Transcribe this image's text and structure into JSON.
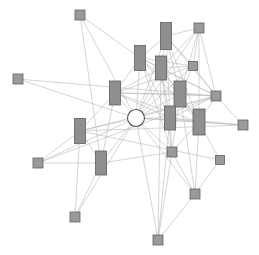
{
  "figure": {
    "title": "",
    "background_color": "#ffffff",
    "width": 259,
    "height": 255
  },
  "style": {
    "edge_color": "#b9b9b9",
    "edge_width": 0.6,
    "rect_fill": "#8f8f8f",
    "rect_stroke": "#5e5e5e",
    "square_fill": "#9a9a9a",
    "square_stroke": "#626262",
    "hub_fill": "#ffffff",
    "hub_stroke": "#4f4f4f"
  },
  "chart_data": {
    "type": "scatter",
    "title": "",
    "xlabel": "",
    "ylabel": "",
    "xlim": [
      0,
      259
    ],
    "ylim": [
      0,
      255
    ],
    "grid": false,
    "legend": null,
    "node_shapes": [
      "hub-circle",
      "rectangle",
      "square"
    ],
    "nodes": [
      {
        "id": "n0",
        "shape": "hub",
        "x": 136,
        "y": 118,
        "w": 17,
        "h": 17,
        "label": ""
      },
      {
        "id": "r1",
        "shape": "rect",
        "x": 140,
        "y": 58,
        "w": 11,
        "h": 25,
        "label": ""
      },
      {
        "id": "r2",
        "shape": "rect",
        "x": 166,
        "y": 36,
        "w": 11,
        "h": 27,
        "label": ""
      },
      {
        "id": "r3",
        "shape": "rect",
        "x": 161,
        "y": 68,
        "w": 11,
        "h": 24,
        "label": ""
      },
      {
        "id": "r4",
        "shape": "rect",
        "x": 115,
        "y": 93,
        "w": 11,
        "h": 24,
        "label": ""
      },
      {
        "id": "r5",
        "shape": "rect",
        "x": 180,
        "y": 94,
        "w": 12,
        "h": 26,
        "label": ""
      },
      {
        "id": "r6",
        "shape": "rect",
        "x": 170,
        "y": 118,
        "w": 11,
        "h": 24,
        "label": ""
      },
      {
        "id": "r7",
        "shape": "rect",
        "x": 199,
        "y": 122,
        "w": 12,
        "h": 26,
        "label": ""
      },
      {
        "id": "r8",
        "shape": "rect",
        "x": 80,
        "y": 131,
        "w": 11,
        "h": 25,
        "label": ""
      },
      {
        "id": "r9",
        "shape": "rect",
        "x": 101,
        "y": 163,
        "w": 11,
        "h": 24,
        "label": ""
      },
      {
        "id": "s1",
        "shape": "square",
        "x": 80,
        "y": 15,
        "w": 10,
        "h": 10,
        "label": ""
      },
      {
        "id": "s2",
        "shape": "square",
        "x": 199,
        "y": 28,
        "w": 10,
        "h": 10,
        "label": ""
      },
      {
        "id": "s3",
        "shape": "square",
        "x": 193,
        "y": 66,
        "w": 9,
        "h": 9,
        "label": ""
      },
      {
        "id": "s4",
        "shape": "square",
        "x": 18,
        "y": 79,
        "w": 10,
        "h": 10,
        "label": ""
      },
      {
        "id": "s5",
        "shape": "square",
        "x": 216,
        "y": 96,
        "w": 10,
        "h": 10,
        "label": ""
      },
      {
        "id": "s6",
        "shape": "square",
        "x": 243,
        "y": 125,
        "w": 10,
        "h": 10,
        "label": ""
      },
      {
        "id": "s7",
        "shape": "square",
        "x": 38,
        "y": 163,
        "w": 10,
        "h": 10,
        "label": ""
      },
      {
        "id": "s8",
        "shape": "square",
        "x": 172,
        "y": 152,
        "w": 10,
        "h": 10,
        "label": ""
      },
      {
        "id": "s9",
        "shape": "square",
        "x": 220,
        "y": 160,
        "w": 9,
        "h": 9,
        "label": ""
      },
      {
        "id": "s10",
        "shape": "square",
        "x": 195,
        "y": 194,
        "w": 10,
        "h": 10,
        "label": ""
      },
      {
        "id": "s11",
        "shape": "square",
        "x": 75,
        "y": 217,
        "w": 10,
        "h": 10,
        "label": ""
      },
      {
        "id": "s12",
        "shape": "square",
        "x": 158,
        "y": 240,
        "w": 10,
        "h": 10,
        "label": ""
      }
    ],
    "edges": [
      [
        "s1",
        "r1"
      ],
      [
        "s1",
        "n0"
      ],
      [
        "s1",
        "r9"
      ],
      [
        "r2",
        "s2"
      ],
      [
        "r2",
        "r3"
      ],
      [
        "r2",
        "n0"
      ],
      [
        "r2",
        "r5"
      ],
      [
        "r2",
        "r6"
      ],
      [
        "r2",
        "s3"
      ],
      [
        "r2",
        "r1"
      ],
      [
        "r2",
        "s5"
      ],
      [
        "r2",
        "r7"
      ],
      [
        "s2",
        "r3"
      ],
      [
        "s2",
        "r5"
      ],
      [
        "s2",
        "s5"
      ],
      [
        "s2",
        "r7"
      ],
      [
        "s2",
        "n0"
      ],
      [
        "s2",
        "s3"
      ],
      [
        "r1",
        "r3"
      ],
      [
        "r1",
        "n0"
      ],
      [
        "r1",
        "r5"
      ],
      [
        "r1",
        "r6"
      ],
      [
        "r1",
        "r7"
      ],
      [
        "r1",
        "s5"
      ],
      [
        "r1",
        "r4"
      ],
      [
        "r1",
        "s3"
      ],
      [
        "r1",
        "s8"
      ],
      [
        "r3",
        "n0"
      ],
      [
        "r3",
        "r5"
      ],
      [
        "r3",
        "r6"
      ],
      [
        "r3",
        "r7"
      ],
      [
        "r3",
        "s5"
      ],
      [
        "r3",
        "s3"
      ],
      [
        "r3",
        "r4"
      ],
      [
        "r3",
        "s8"
      ],
      [
        "r3",
        "s12"
      ],
      [
        "r4",
        "n0"
      ],
      [
        "r4",
        "r5"
      ],
      [
        "r4",
        "r6"
      ],
      [
        "r4",
        "s5"
      ],
      [
        "r4",
        "r7"
      ],
      [
        "r4",
        "s3"
      ],
      [
        "r4",
        "r8"
      ],
      [
        "r4",
        "r9"
      ],
      [
        "s4",
        "s5"
      ],
      [
        "s4",
        "n0"
      ],
      [
        "r5",
        "n0"
      ],
      [
        "r5",
        "r6"
      ],
      [
        "r5",
        "r7"
      ],
      [
        "r5",
        "s5"
      ],
      [
        "r5",
        "s3"
      ],
      [
        "r5",
        "s8"
      ],
      [
        "r5",
        "s10"
      ],
      [
        "r6",
        "n0"
      ],
      [
        "r6",
        "r7"
      ],
      [
        "r6",
        "s5"
      ],
      [
        "r6",
        "s8"
      ],
      [
        "r6",
        "s12"
      ],
      [
        "r6",
        "s6"
      ],
      [
        "r7",
        "n0"
      ],
      [
        "r7",
        "s5"
      ],
      [
        "r7",
        "s6"
      ],
      [
        "r7",
        "s9"
      ],
      [
        "r7",
        "s8"
      ],
      [
        "r7",
        "s10"
      ],
      [
        "s5",
        "n0"
      ],
      [
        "s5",
        "s6"
      ],
      [
        "s5",
        "r8"
      ],
      [
        "s5",
        "s7"
      ],
      [
        "n0",
        "r8"
      ],
      [
        "n0",
        "r9"
      ],
      [
        "n0",
        "s7"
      ],
      [
        "n0",
        "s8"
      ],
      [
        "n0",
        "s11"
      ],
      [
        "n0",
        "s12"
      ],
      [
        "n0",
        "s6"
      ],
      [
        "n0",
        "s10"
      ],
      [
        "r8",
        "r9"
      ],
      [
        "r8",
        "s7"
      ],
      [
        "r8",
        "s6"
      ],
      [
        "r8",
        "s9"
      ],
      [
        "r9",
        "s7"
      ],
      [
        "r9",
        "s11"
      ],
      [
        "r9",
        "s8"
      ],
      [
        "s8",
        "s10"
      ],
      [
        "s8",
        "s12"
      ],
      [
        "s10",
        "s12"
      ],
      [
        "s10",
        "s9"
      ],
      [
        "s3",
        "s5"
      ],
      [
        "s3",
        "n0"
      ],
      [
        "s11",
        "r8"
      ]
    ]
  }
}
